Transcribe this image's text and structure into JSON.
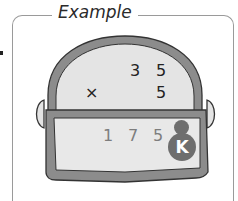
{
  "panel": {
    "title": "Example"
  },
  "calculation": {
    "top_row": [
      "3",
      "5"
    ],
    "operator": "×",
    "second_row": "5"
  },
  "display": {
    "digits": [
      "1",
      "7",
      "5"
    ],
    "badge_letter": "K"
  },
  "colors": {
    "device_rim": "#8c8c8c",
    "device_face": "#e4e4e4",
    "screen": "#e8e8e8",
    "badge": "#6e6e6e",
    "screen_digits": "#7d7d7d"
  }
}
